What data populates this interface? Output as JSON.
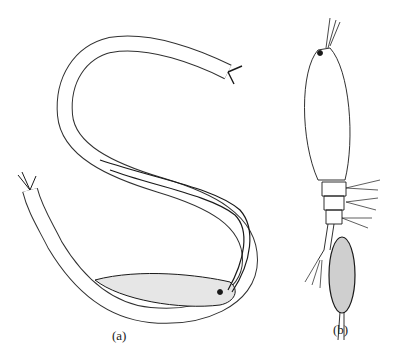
{
  "figure": {
    "panels": [
      {
        "id": "a",
        "label": "(a)",
        "subject": "segmented worm with setae and internal parasite"
      },
      {
        "id": "b",
        "label": "(b)",
        "subject": "copepod with egg sac"
      }
    ]
  },
  "colors": {
    "ink": "#1a1a1a",
    "background": "#ffffff"
  }
}
